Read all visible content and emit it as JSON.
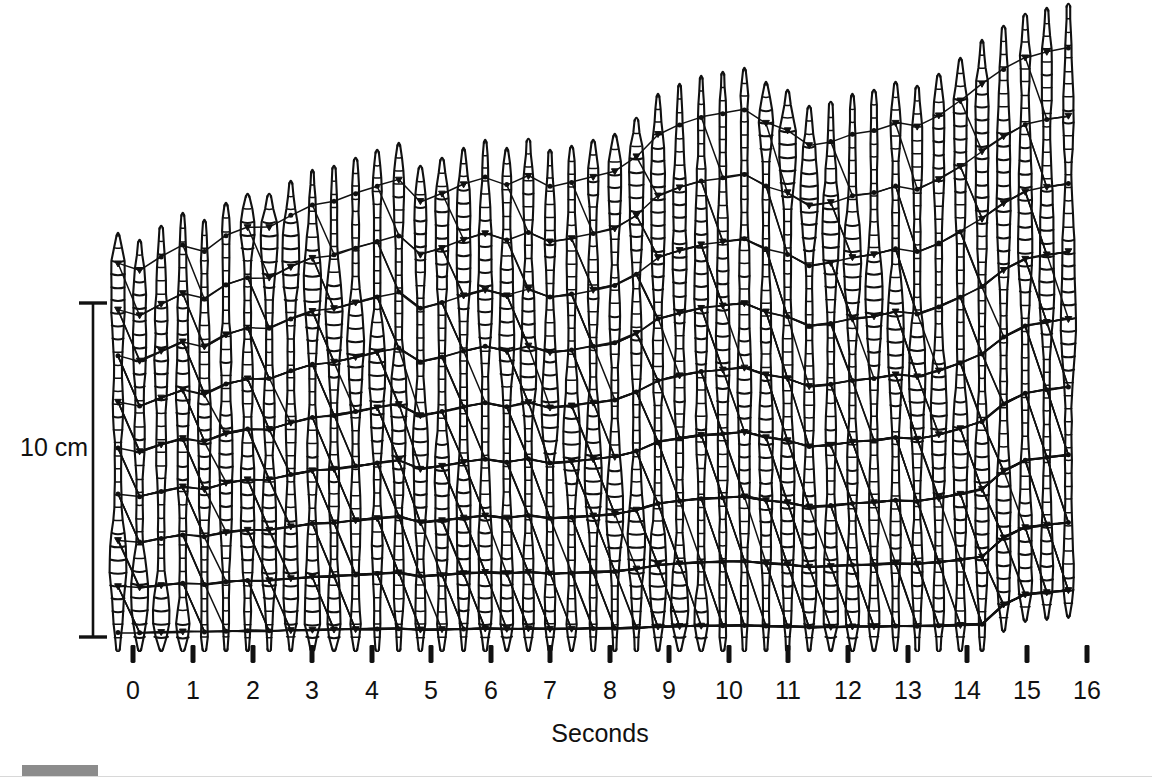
{
  "figure": {
    "kind": "kymograph",
    "background_color": "#ffffff",
    "ink_color": "#111111",
    "width": 1152,
    "height": 777
  },
  "axis": {
    "title": "Seconds",
    "title_x": 600,
    "title_y": 719,
    "tick_labels": [
      "0",
      "1",
      "2",
      "3",
      "4",
      "5",
      "6",
      "7",
      "8",
      "9",
      "10",
      "11",
      "12",
      "13",
      "14",
      "15",
      "16"
    ],
    "tick_values": [
      0,
      1,
      2,
      3,
      4,
      5,
      6,
      7,
      8,
      9,
      10,
      11,
      12,
      13,
      14,
      15,
      16
    ],
    "tick_x_px": [
      133,
      193,
      253,
      312,
      372,
      431,
      491,
      550,
      610,
      669,
      729,
      788,
      848,
      908,
      967,
      1027,
      1087
    ],
    "tick_label_y": 676,
    "tick_mark_y_top": 645,
    "tick_mark_y_bottom": 663,
    "tick_mark_width": 5
  },
  "scale_bar": {
    "label": "10 cm",
    "value": 10,
    "unit": "cm",
    "x_px": 93,
    "y_top_px": 303,
    "y_bottom_px": 637,
    "length_px": 334,
    "cap_half_width_px": 14,
    "label_x": 20,
    "label_y": 433
  },
  "footer": {
    "bar_color": "#8c8c8c",
    "bar_x": 22,
    "bar_y": 765,
    "bar_width": 76,
    "bar_height": 11
  },
  "chart_data": {
    "type": "line",
    "title": "",
    "subtitle": "",
    "xlabel": "Seconds",
    "ylabel": "",
    "xlim": [
      -0.3,
      16.8
    ],
    "ylim": [
      0,
      24
    ],
    "grid": false,
    "legend": null,
    "annotations": [
      {
        "text": "10 cm",
        "kind": "scale-bar",
        "x": 93,
        "y_top": 303,
        "y_bottom": 637
      }
    ],
    "categories": [
      "0",
      "1",
      "2",
      "3",
      "4",
      "5",
      "6",
      "7",
      "8",
      "9",
      "10",
      "11",
      "12",
      "13",
      "14",
      "15",
      "16"
    ],
    "series": [
      {
        "name": "body-top-position-cm",
        "units": "cm",
        "x": [
          0,
          1,
          2,
          3,
          4,
          5,
          6,
          7,
          8,
          9,
          10,
          11,
          12,
          13,
          14,
          15,
          16
        ],
        "values": [
          12.6,
          12.9,
          13.4,
          14.6,
          15.4,
          16.0,
          16.6,
          15.7,
          18.4,
          18.8,
          18.3,
          18.4,
          18.8,
          19.4,
          21.0,
          22.5,
          23.3
        ]
      },
      {
        "name": "body-bottom-position-cm",
        "units": "cm",
        "x": [
          0,
          1,
          2,
          3,
          4,
          5,
          6,
          7,
          8,
          9,
          10,
          11,
          12,
          13,
          14,
          15,
          16
        ],
        "values": [
          0.2,
          0.3,
          0.4,
          0.4,
          0.5,
          0.4,
          0.4,
          0.3,
          0.4,
          0.4,
          0.5,
          0.4,
          0.4,
          0.5,
          1.0,
          1.1,
          1.0
        ]
      }
    ],
    "worm_profiles": {
      "count": 45,
      "x_start_px": 118,
      "x_step_px": 21.6,
      "baseline_y_px": 650,
      "note": "Each profile is a vertical chain of body segments; wide bulges mark circular-muscle relaxation / longitudinal contraction, narrow necks mark extension. Black dots mark tracked segment landmarks.",
      "tops_y_px": [
        235,
        242,
        228,
        215,
        222,
        205,
        196,
        196,
        183,
        172,
        168,
        160,
        152,
        145,
        168,
        160,
        150,
        142,
        150,
        141,
        152,
        148,
        142,
        136,
        120,
        96,
        86,
        78,
        74,
        70,
        84,
        92,
        108,
        104,
        96,
        92,
        84,
        88,
        76,
        60,
        42,
        28,
        16,
        10,
        6
      ],
      "bottoms_y_px": [
        650,
        650,
        650,
        650,
        650,
        650,
        650,
        650,
        650,
        650,
        650,
        650,
        650,
        650,
        650,
        650,
        650,
        650,
        650,
        650,
        650,
        650,
        650,
        650,
        650,
        650,
        650,
        650,
        650,
        650,
        650,
        650,
        650,
        650,
        650,
        650,
        650,
        650,
        650,
        650,
        650,
        630,
        620,
        618,
        616
      ]
    },
    "tie_lines": {
      "count": 9,
      "direction": "down-left-to-up-right",
      "note": "Tie-lines join the same body landmark in successive frames; their slope gives the backward wave velocity relative to ground."
    }
  }
}
